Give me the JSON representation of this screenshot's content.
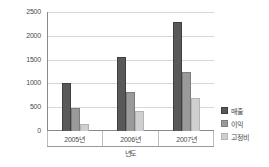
{
  "chart_data": {
    "type": "bar",
    "title": "",
    "subtitle": "",
    "xlabel": "년도",
    "ylabel": "",
    "categories": [
      "2005년",
      "2006년",
      "2007년"
    ],
    "series": [
      {
        "name": "매출",
        "values": [
          1000,
          1550,
          2280
        ],
        "color": "#595959"
      },
      {
        "name": "이익",
        "values": [
          480,
          830,
          1240
        ],
        "color": "#9a9a9a"
      },
      {
        "name": "고정비",
        "values": [
          150,
          420,
          690
        ],
        "color": "#cfcfcf"
      }
    ],
    "ylim": [
      0,
      2500
    ],
    "yticks": [
      0,
      500,
      1000,
      1500,
      2000,
      2500
    ],
    "ytick_labels": [
      "0",
      "500",
      "1000",
      "1500",
      "2000",
      "2500"
    ],
    "grid": true,
    "legend_position": "right-bottom",
    "orientation": "vertical",
    "grouped": true
  }
}
